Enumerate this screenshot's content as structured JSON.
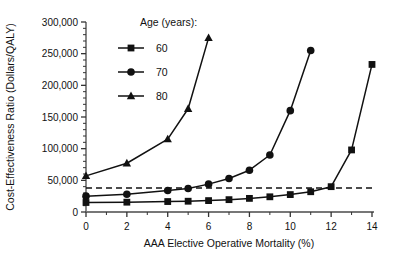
{
  "chart_data": {
    "type": "line",
    "title": "",
    "xlabel": "AAA Elective Operative Mortality (%)",
    "ylabel": "Cost-Effectiveness Ratio (Dollars/QALY)",
    "xlim": [
      0,
      14
    ],
    "ylim": [
      0,
      300000
    ],
    "xticks": [
      0,
      2,
      4,
      6,
      8,
      10,
      12,
      14
    ],
    "xtick_labels": [
      "0",
      "2",
      "4",
      "6",
      "8",
      "10",
      "12",
      "14"
    ],
    "yticks": [
      0,
      50000,
      100000,
      150000,
      200000,
      250000,
      300000
    ],
    "ytick_labels": [
      "0",
      "50,000",
      "100,000",
      "150,000",
      "200,000",
      "250,000",
      "300,000"
    ],
    "y_minor_tick_step": 10000,
    "grid": false,
    "legend_position": "top-center",
    "legend_title": "Age (years):",
    "annotations": [
      {
        "name": "willingness-to-pay-threshold",
        "type": "horizontal-dashed-line",
        "value": 38000,
        "label": ""
      }
    ],
    "series": [
      {
        "name": "60",
        "legend_label": "60",
        "marker": "square",
        "color": "#111111",
        "x": [
          0,
          2,
          4,
          5,
          6,
          7,
          8,
          9,
          10,
          11,
          12,
          13,
          14
        ],
        "values": [
          15000,
          15500,
          16500,
          17000,
          18000,
          19500,
          21500,
          24000,
          27500,
          32000,
          40000,
          98000,
          233000
        ]
      },
      {
        "name": "70",
        "legend_label": "70",
        "marker": "circle",
        "color": "#111111",
        "x": [
          0,
          2,
          4,
          5,
          6,
          7,
          8,
          9,
          10,
          11
        ],
        "values": [
          25000,
          28000,
          34000,
          37000,
          44000,
          53000,
          66000,
          90000,
          160000,
          255000
        ]
      },
      {
        "name": "80",
        "legend_label": "80",
        "marker": "triangle",
        "color": "#111111",
        "x": [
          0,
          2,
          4,
          5,
          6
        ],
        "values": [
          57000,
          77000,
          115000,
          163000,
          275000
        ]
      }
    ]
  }
}
